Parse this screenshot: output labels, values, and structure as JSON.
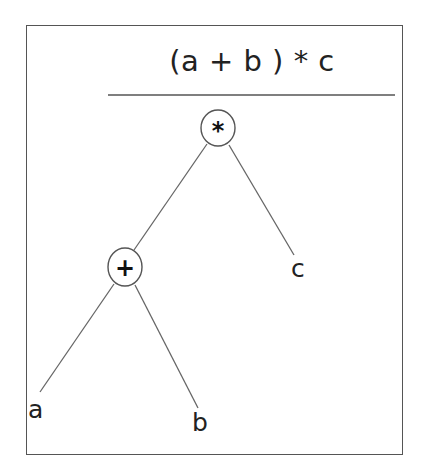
{
  "diagram": {
    "title": "(a + b ) * c",
    "type": "expression-tree",
    "nodes": [
      {
        "id": "root",
        "label": "*",
        "kind": "operator",
        "cx": 218,
        "cy": 128,
        "rx": 17,
        "ry": 19
      },
      {
        "id": "plus",
        "label": "+",
        "kind": "operator",
        "cx": 125,
        "cy": 267,
        "rx": 17,
        "ry": 19
      },
      {
        "id": "c",
        "label": "c",
        "kind": "operand"
      },
      {
        "id": "a",
        "label": "a",
        "kind": "operand"
      },
      {
        "id": "b",
        "label": "b",
        "kind": "operand"
      }
    ],
    "edges": [
      {
        "from": "*",
        "to": "+"
      },
      {
        "from": "*",
        "to": "c"
      },
      {
        "from": "+",
        "to": "a"
      },
      {
        "from": "+",
        "to": "b"
      }
    ],
    "colors": {
      "stroke": "#555555",
      "text": "#222222",
      "background": "#ffffff"
    }
  }
}
